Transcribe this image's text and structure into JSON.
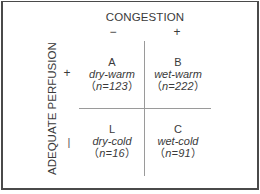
{
  "diagram": {
    "column_axis": {
      "title": "CONGESTION",
      "negative_sign": "−",
      "positive_sign": "+"
    },
    "row_axis": {
      "title": "ADEQUATE PERFUSION",
      "positive_sign": "+",
      "negative_sign": "|"
    },
    "quadrants": [
      {
        "letter": "A",
        "label": "dry-warm",
        "n_open": "（",
        "n_text": "n=123",
        "n_close": "）"
      },
      {
        "letter": "B",
        "label": "wet-warm",
        "n_open": "（",
        "n_text": "n=222",
        "n_close": "）"
      },
      {
        "letter": "L",
        "label": "dry-cold",
        "n_open": "（",
        "n_text": "n=16",
        "n_close": "）"
      },
      {
        "letter": "C",
        "label": "wet-cold",
        "n_open": "（",
        "n_text": "n=91",
        "n_close": "）"
      }
    ],
    "colors": {
      "border": "#4a4a4a",
      "grid_lines": "#9a9a9a",
      "text": "#3a3a3a",
      "background": "#ffffff"
    }
  }
}
